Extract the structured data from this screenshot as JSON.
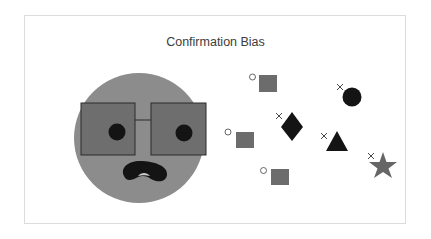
{
  "title": "Confirmation Bias",
  "colors": {
    "face": "#8c8c8c",
    "lens": "#6e6e6e",
    "lens_border": "#2a2a2a",
    "dark": "#141414",
    "square": "#6c6c6c",
    "star": "#666666",
    "frame_border": "#dcdcdc"
  },
  "face": {
    "description": "Person wearing tinted glasses with worried/frowning mouth",
    "glasses": "tinted square lenses"
  },
  "markers": {
    "circle_mark": "○",
    "cross_mark": "×"
  },
  "shapes": [
    {
      "kind": "square",
      "marker": "circle",
      "label": "accepted evidence"
    },
    {
      "kind": "square",
      "marker": "circle",
      "label": "accepted evidence"
    },
    {
      "kind": "square",
      "marker": "circle",
      "label": "accepted evidence"
    },
    {
      "kind": "diamond",
      "marker": "cross",
      "label": "rejected evidence"
    },
    {
      "kind": "circle",
      "marker": "cross",
      "label": "rejected evidence"
    },
    {
      "kind": "triangle",
      "marker": "cross",
      "label": "rejected evidence"
    },
    {
      "kind": "star",
      "marker": "cross",
      "label": "rejected evidence"
    }
  ]
}
